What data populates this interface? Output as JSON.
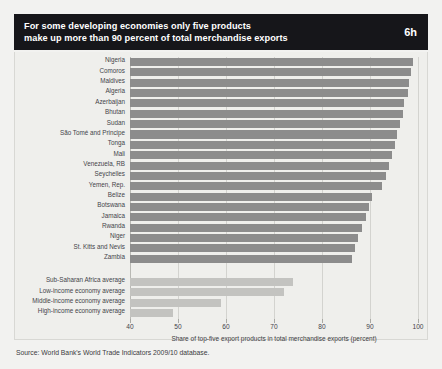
{
  "header": {
    "line1": "For some developing economies only five products",
    "line2": "make up more than 90 percent of total merchandise exports",
    "badge": "6h"
  },
  "source": "Source: World Bank's World Trade Indicators 2009/10 database.",
  "colors": {
    "header_bg": "#16161a",
    "bar": "#8c8c8c",
    "bar_average": "#c3c3c0",
    "panel_bg": "#efefec",
    "text": "#44444a"
  },
  "chart_data": {
    "type": "bar",
    "orientation": "horizontal",
    "title": "For some developing economies only five products make up more than 90 percent of total merchandise exports",
    "xlabel": "Share of top-five export products in total merchandise exports (percent)",
    "ylabel": "",
    "xlim": [
      40,
      100
    ],
    "xticks": [
      40,
      50,
      60,
      70,
      80,
      90,
      100
    ],
    "grid": true,
    "legend": false,
    "categories": [
      "Nigeria",
      "Comoros",
      "Maldives",
      "Algeria",
      "Azerbaijan",
      "Bhutan",
      "Sudan",
      "São Tomé and Principe",
      "Tonga",
      "Mali",
      "Venezuela, RB",
      "Seychelles",
      "Yemen, Rep.",
      "Belize",
      "Botswana",
      "Jamaica",
      "Rwanda",
      "Niger",
      "St. Kitts and Nevis",
      "Zambia",
      "Sub-Saharan Africa average",
      "Low-income economy average",
      "Middle-income economy average",
      "High-income economy average"
    ],
    "values": [
      99.0,
      98.6,
      98.2,
      98.0,
      97.0,
      96.8,
      96.3,
      95.6,
      95.2,
      94.6,
      94.0,
      93.4,
      92.6,
      90.4,
      89.8,
      89.2,
      88.4,
      87.4,
      86.8,
      86.2,
      74.0,
      72.0,
      59.0,
      49.0
    ],
    "series_groups": [
      {
        "name": "Country",
        "count": 20,
        "color": "#8c8c8c"
      },
      {
        "name": "Average",
        "count": 4,
        "color": "#c3c3c0"
      }
    ]
  }
}
